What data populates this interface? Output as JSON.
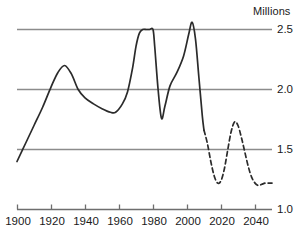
{
  "chart_data": {
    "type": "line",
    "title": "",
    "subtitle": "",
    "xlabel": "",
    "ylabel": "Millions",
    "unit_label": "Millions",
    "xlim": [
      1900,
      2050
    ],
    "ylim": [
      1.0,
      2.6
    ],
    "grid": "horizontal-only",
    "gridlines": [
      2.5,
      2.0,
      1.5
    ],
    "legend": "none",
    "xticks": [
      1900,
      1920,
      1940,
      1960,
      1980,
      2000,
      2020,
      2040
    ],
    "xtick_labels": [
      "1900",
      "1920",
      "1940",
      "1960",
      "1980",
      "2000",
      "2020",
      "2040"
    ],
    "yticks": [
      2.5,
      2.0,
      1.5,
      1.0
    ],
    "ytick_labels": [
      "2.5",
      "2.0",
      "1.5",
      "1.0"
    ],
    "series": [
      {
        "name": "historical",
        "style": "solid",
        "color": "#2b2b2b",
        "x": [
          1900,
          1905,
          1910,
          1915,
          1920,
          1924,
          1928,
          1932,
          1936,
          1940,
          1945,
          1950,
          1955,
          1958,
          1962,
          1965,
          1968,
          1970,
          1972,
          1974,
          1976,
          1978,
          1980,
          1981,
          1983,
          1985,
          1987,
          1990,
          1994,
          1998,
          2001,
          2003,
          2005,
          2007,
          2009,
          2010
        ],
        "y": [
          1.4,
          1.55,
          1.7,
          1.85,
          2.02,
          2.14,
          2.2,
          2.13,
          2.0,
          1.93,
          1.88,
          1.84,
          1.81,
          1.81,
          1.88,
          1.98,
          2.18,
          2.36,
          2.47,
          2.5,
          2.5,
          2.5,
          2.5,
          2.36,
          2.0,
          1.76,
          1.86,
          2.03,
          2.14,
          2.28,
          2.46,
          2.56,
          2.42,
          2.1,
          1.78,
          1.66
        ]
      },
      {
        "name": "projection",
        "style": "dashed",
        "color": "#2b2b2b",
        "x": [
          2010,
          2012,
          2014,
          2016,
          2018,
          2020,
          2022,
          2024,
          2026,
          2028,
          2030,
          2032,
          2034,
          2036,
          2038,
          2040,
          2042,
          2044,
          2046,
          2048,
          2050
        ],
        "y": [
          1.66,
          1.55,
          1.4,
          1.28,
          1.22,
          1.24,
          1.34,
          1.5,
          1.65,
          1.73,
          1.7,
          1.6,
          1.48,
          1.36,
          1.27,
          1.22,
          1.2,
          1.21,
          1.22,
          1.22,
          1.22
        ]
      }
    ],
    "annotations": [
      {
        "text": "Millions",
        "position": "top-right"
      }
    ],
    "colors": {
      "line": "#2b2b2b",
      "gridline": "#8c8c8c",
      "axis": "#6e6e6e",
      "text": "#1a1a1a",
      "background": "#ffffff"
    }
  }
}
